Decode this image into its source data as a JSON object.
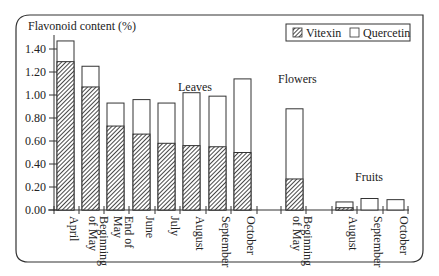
{
  "chart_data": {
    "type": "bar",
    "stacked": true,
    "title": "",
    "ylabel": "Flavonoid content (%)",
    "xlabel": "",
    "ylim": [
      0,
      1.5
    ],
    "yticks": [
      "0.00",
      "0.20",
      "0.40",
      "0.60",
      "0.80",
      "1.00",
      "1.20",
      "1.40"
    ],
    "grid": false,
    "legend_position": "top-right",
    "legend": [
      {
        "name": "Vitexin",
        "pattern": "hatched"
      },
      {
        "name": "Quercetin",
        "pattern": "empty"
      }
    ],
    "groups": [
      {
        "label": "Leaves",
        "categories": [
          "April",
          "Beginning of May",
          "End of May",
          "June",
          "July",
          "August",
          "September",
          "October"
        ]
      },
      {
        "label": "Flowers",
        "categories": [
          "Beginning of May"
        ]
      },
      {
        "label": "Fruits",
        "categories": [
          "August",
          "September",
          "October"
        ]
      }
    ],
    "categories": [
      "April",
      "Beginning of May",
      "End of May",
      "June",
      "July",
      "August",
      "September",
      "October",
      "Beginning of May (Flowers)",
      "August (Fruits)",
      "September (Fruits)",
      "October (Fruits)"
    ],
    "series": [
      {
        "name": "Vitexin",
        "values": [
          1.29,
          1.07,
          0.73,
          0.66,
          0.58,
          0.56,
          0.55,
          0.5,
          0.27,
          0.02,
          0.0,
          0.0
        ]
      },
      {
        "name": "Quercetin",
        "values": [
          0.18,
          0.18,
          0.2,
          0.3,
          0.35,
          0.46,
          0.44,
          0.64,
          0.61,
          0.05,
          0.1,
          0.09
        ]
      }
    ],
    "totals": [
      1.47,
      1.25,
      0.93,
      0.96,
      0.93,
      1.02,
      0.99,
      1.14,
      0.88,
      0.07,
      0.1,
      0.09
    ]
  },
  "labels": {
    "ylabel": "Flavonoid content (%)",
    "leaves": "Leaves",
    "flowers": "Flowers",
    "fruits": "Fruits",
    "legend_vitexin": "Vitexin",
    "legend_quercetin": "Quercetin"
  },
  "bars": [
    {
      "x": 57,
      "label": [
        "April"
      ]
    },
    {
      "x": 82,
      "label": [
        "Beginning",
        "of May"
      ]
    },
    {
      "x": 107,
      "label": [
        "End of",
        "May"
      ]
    },
    {
      "x": 133,
      "label": [
        "June"
      ]
    },
    {
      "x": 158,
      "label": [
        "July"
      ]
    },
    {
      "x": 183,
      "label": [
        "August"
      ]
    },
    {
      "x": 209,
      "label": [
        "September"
      ]
    },
    {
      "x": 234,
      "label": [
        "October"
      ]
    },
    {
      "x": 286,
      "label": [
        "Beginning",
        "of May"
      ]
    },
    {
      "x": 336,
      "label": [
        "August"
      ]
    },
    {
      "x": 361,
      "label": [
        "September"
      ]
    },
    {
      "x": 387,
      "label": [
        "October"
      ]
    }
  ]
}
